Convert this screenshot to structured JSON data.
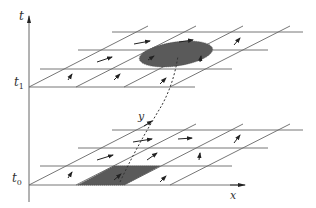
{
  "diagram": {
    "type": "space-time lattice diagram",
    "labels": {
      "t_axis": "t",
      "t1": "t",
      "t1_sub": "1",
      "t0": "t",
      "t0_sub": "0",
      "x_axis": "x",
      "y_axis": "y"
    },
    "planes": [
      {
        "name": "upper-plane",
        "time": "t1",
        "region_shape": "ellipse"
      },
      {
        "name": "lower-plane",
        "time": "t0",
        "region_shape": "parallelogram"
      }
    ],
    "connector": "dashed trajectory from lower region to upper region",
    "colors": {
      "line": "#555555",
      "region_fill": "#5a5a5a",
      "arrow": "#222222",
      "background": "#ffffff"
    }
  }
}
